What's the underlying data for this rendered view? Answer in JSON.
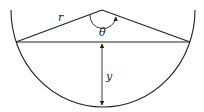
{
  "figure": {
    "labels": {
      "radius": "r",
      "angle": "θ",
      "depth": "y"
    },
    "colors": {
      "stroke": "#222222",
      "background": "#ffffff"
    }
  }
}
